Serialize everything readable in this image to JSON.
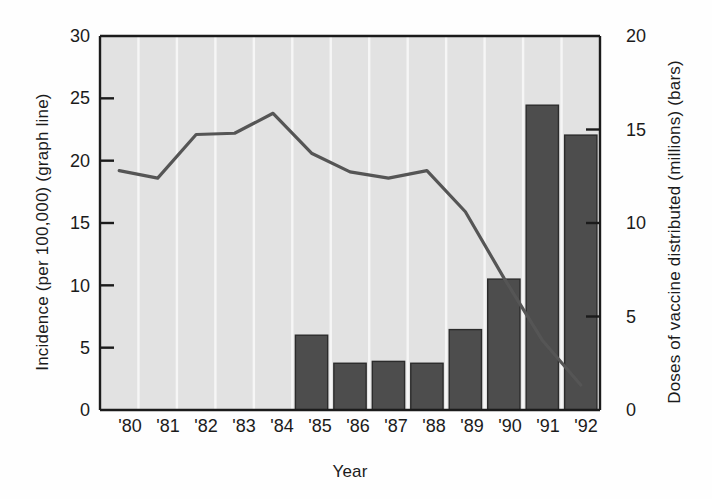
{
  "chart_data": {
    "type": "bar",
    "title": "",
    "xlabel": "Year",
    "ylabel": "Incidence (per 100,000) (graph line)",
    "ylabel_right": "Doses of vaccine distributed (millions) (bars)",
    "categories": [
      "'80",
      "'81",
      "'82",
      "'83",
      "'84",
      "'85",
      "'86",
      "'87",
      "'88",
      "'89",
      "'90",
      "'91",
      "'92"
    ],
    "ylim": [
      0,
      30
    ],
    "ylim_right": [
      0,
      20
    ],
    "yticks": [
      "0",
      "5",
      "10",
      "15",
      "20",
      "25",
      "30"
    ],
    "yticks_right": [
      "0",
      "5",
      "10",
      "15",
      "20"
    ],
    "grid": true,
    "legend_position": "none",
    "series": [
      {
        "name": "Doses of vaccine distributed (millions) (bars)",
        "type": "bar",
        "axis": "right",
        "color": "#4d4d4d",
        "values": [
          null,
          null,
          null,
          null,
          null,
          4.0,
          2.5,
          2.6,
          2.5,
          4.3,
          7.0,
          16.3,
          14.7
        ]
      },
      {
        "name": "Incidence (per 100,000) (graph line)",
        "type": "line",
        "axis": "left",
        "color": "#555555",
        "values": [
          19.2,
          18.6,
          22.1,
          22.2,
          23.8,
          20.6,
          19.1,
          18.6,
          19.2,
          15.9,
          10.6,
          5.6,
          2.0
        ]
      }
    ]
  },
  "figure": {
    "plot_background": "#e2e2e2",
    "gridline_color": "#f7f7f7",
    "frame_color": "#1b1b1b"
  }
}
